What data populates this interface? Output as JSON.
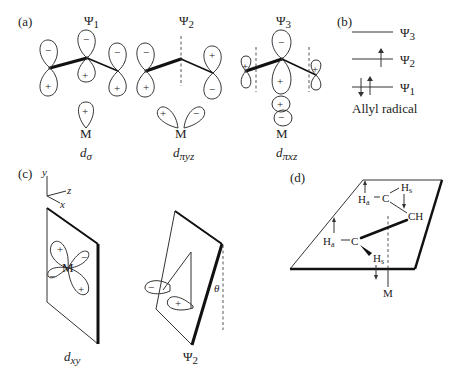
{
  "panels": {
    "a": {
      "label": "(a)",
      "orbitals": [
        {
          "name": "Ψ1",
          "sub": "1",
          "metal": "M",
          "metal_orbital": "dσ",
          "metal_sub": "σ",
          "lobe_signs": [
            "−",
            "+",
            "−",
            "+",
            "−",
            "+"
          ],
          "metal_signs": [
            "+"
          ]
        },
        {
          "name": "Ψ2",
          "sub": "2",
          "metal": "M",
          "metal_orbital": "dπyz",
          "metal_sub": "πyz",
          "lobe_signs": [
            "−",
            "+",
            "+",
            "−"
          ],
          "metal_signs": [
            "+",
            "−"
          ]
        },
        {
          "name": "Ψ3",
          "sub": "3",
          "metal": "M",
          "metal_orbital": "dπxz",
          "metal_sub": "πxz",
          "lobe_signs": [
            "+",
            "−",
            "+",
            "+"
          ],
          "metal_signs": [
            "+",
            "−"
          ]
        }
      ]
    },
    "b": {
      "label": "(b)",
      "levels": [
        {
          "name": "Ψ3",
          "sub": "3",
          "electrons": ""
        },
        {
          "name": "Ψ2",
          "sub": "2",
          "electrons": "↑"
        },
        {
          "name": "Ψ1",
          "sub": "1",
          "electrons": "↓↑"
        }
      ],
      "caption": "Allyl radical"
    },
    "c": {
      "label": "(c)",
      "axes": {
        "y": "y",
        "z": "z",
        "x": "x"
      },
      "left": {
        "metal": "M",
        "signs": [
          "+",
          "−",
          "−",
          "+"
        ],
        "caption": "d",
        "caption_sub": "xy"
      },
      "right": {
        "signs": [
          "−",
          "+"
        ],
        "angle": "θ",
        "caption": "Ψ",
        "caption_sub": "2"
      }
    },
    "d": {
      "label": "(d)",
      "atoms": {
        "ha_top": "H",
        "ha_top_sub": "a",
        "c_top": "C",
        "hs_top": "H",
        "hs_top_sub": "s",
        "ch": "CH",
        "ha_bot": "H",
        "ha_bot_sub": "a",
        "c_bot": "C",
        "hs_bot": "H",
        "hs_bot_sub": "s",
        "metal": "M"
      }
    }
  }
}
